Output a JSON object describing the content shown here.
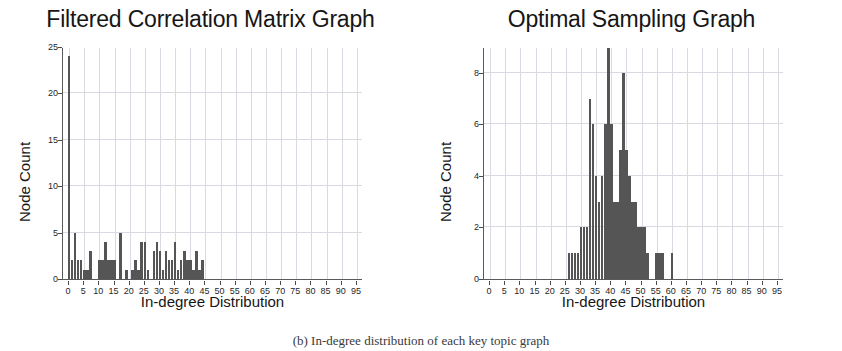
{
  "caption": "(b) In-degree distribution of each key topic graph",
  "colors": {
    "bar": "#555555",
    "grid": "#d9d9e2",
    "axis": "#5a5a5a",
    "text": "#161616"
  },
  "figures": [
    {
      "id": "left",
      "title": "Filtered Correlation Matrix Graph",
      "xlabel": "In-degree Distribution",
      "ylabel": "Node Count"
    },
    {
      "id": "right",
      "title": "Optimal Sampling Graph",
      "xlabel": "In-degree Distribution",
      "ylabel": "Node Count"
    }
  ],
  "chart_data": [
    {
      "type": "bar",
      "title": "Filtered Correlation Matrix Graph",
      "xlabel": "In-degree Distribution",
      "ylabel": "Node Count",
      "xlim": [
        -2,
        97
      ],
      "ylim": [
        0,
        25
      ],
      "grid": true,
      "xticks": [
        0,
        5,
        10,
        15,
        20,
        25,
        30,
        35,
        40,
        45,
        50,
        55,
        60,
        65,
        70,
        75,
        80,
        85,
        90,
        95
      ],
      "yticks": [
        0,
        5,
        10,
        15,
        20,
        25
      ],
      "legend": "none",
      "x": [
        0,
        1,
        2,
        3,
        4,
        5,
        6,
        7,
        8,
        9,
        10,
        11,
        12,
        13,
        14,
        15,
        16,
        17,
        18,
        19,
        20,
        21,
        22,
        23,
        24,
        25,
        26,
        27,
        28,
        29,
        30,
        31,
        32,
        33,
        34,
        35,
        36,
        37,
        38,
        39,
        40,
        41,
        42,
        43,
        44
      ],
      "values": [
        24,
        2,
        5,
        2,
        2,
        1,
        1,
        3,
        0,
        0,
        2,
        2,
        4,
        2,
        2,
        2,
        0,
        5,
        0,
        1,
        0,
        1,
        2,
        1,
        4,
        4,
        1,
        0,
        3,
        4,
        3,
        1,
        3,
        2,
        2,
        4,
        1,
        2,
        3,
        2,
        2,
        1,
        3,
        1,
        2
      ]
    },
    {
      "type": "bar",
      "title": "Optimal Sampling Graph",
      "xlabel": "In-degree Distribution",
      "ylabel": "Node Count",
      "xlim": [
        -2,
        97
      ],
      "ylim": [
        0,
        9
      ],
      "grid": true,
      "xticks": [
        0,
        5,
        10,
        15,
        20,
        25,
        30,
        35,
        40,
        45,
        50,
        55,
        60,
        65,
        70,
        75,
        80,
        85,
        90,
        95
      ],
      "yticks": [
        0,
        2,
        4,
        6,
        8
      ],
      "legend": "none",
      "x": [
        26,
        27,
        28,
        29,
        30,
        31,
        32,
        33,
        34,
        35,
        36,
        37,
        38,
        39,
        40,
        41,
        42,
        43,
        44,
        45,
        46,
        47,
        48,
        49,
        50,
        51,
        52,
        53,
        54,
        55,
        56,
        57,
        58,
        59,
        60
      ],
      "values": [
        1,
        1,
        1,
        1,
        2,
        2,
        2,
        7,
        6,
        4,
        3,
        4,
        6,
        9,
        6,
        3,
        3,
        5,
        8,
        5,
        4,
        3,
        3,
        2,
        2,
        2,
        1,
        0,
        0,
        1,
        1,
        1,
        0,
        0,
        1
      ]
    }
  ]
}
